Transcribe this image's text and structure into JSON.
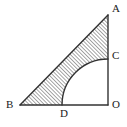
{
  "figure": {
    "canvas": {
      "width": 127,
      "height": 127,
      "background": "#ffffff"
    },
    "style": {
      "stroke_color": "#333333",
      "stroke_width": 1.4,
      "arc_stroke_width": 1.4,
      "hatch_color": "#444444",
      "hatch_spacing": 1.9,
      "hatch_angle_deg": 45,
      "label_color": "#1a1a1a",
      "label_font_size": 11
    },
    "points": [
      {
        "id": "A",
        "label": "A",
        "x": 108,
        "y": 15,
        "label_x": 112,
        "label_y": 3,
        "desc": "apex-top-right"
      },
      {
        "id": "B",
        "label": "B",
        "x": 20,
        "y": 105,
        "label_x": 6,
        "label_y": 99,
        "desc": "apex-bottom-left"
      },
      {
        "id": "C",
        "label": "C",
        "x": 108,
        "y": 58,
        "label_x": 112,
        "label_y": 50,
        "desc": "arc-end-on-vertical-leg"
      },
      {
        "id": "D",
        "label": "D",
        "x": 64,
        "y": 105,
        "label_x": 60,
        "label_y": 108,
        "desc": "arc-end-on-horizontal-leg"
      },
      {
        "id": "O",
        "label": "O",
        "x": 108,
        "y": 105,
        "label_x": 112,
        "label_y": 99,
        "desc": "right-angle-vertex"
      }
    ],
    "segments": [
      {
        "id": "AB",
        "from": "B",
        "to": "A",
        "role": "hypotenuse"
      },
      {
        "id": "AO",
        "from": "A",
        "to": "O",
        "role": "vertical-leg"
      },
      {
        "id": "BO",
        "from": "B",
        "to": "O",
        "role": "horizontal-leg"
      }
    ],
    "arc": {
      "id": "CD",
      "center": "O",
      "center_x": 108,
      "center_y": 105,
      "radius": 46,
      "from": "C",
      "to": "D",
      "start_angle_deg": 90,
      "end_angle_deg": 180,
      "role": "quarter-circle"
    },
    "shaded_region": {
      "id": "shaded",
      "description": "triangle ABO minus quarter disc centered at O",
      "fill": "hatched"
    },
    "right_angle_at": "O"
  }
}
